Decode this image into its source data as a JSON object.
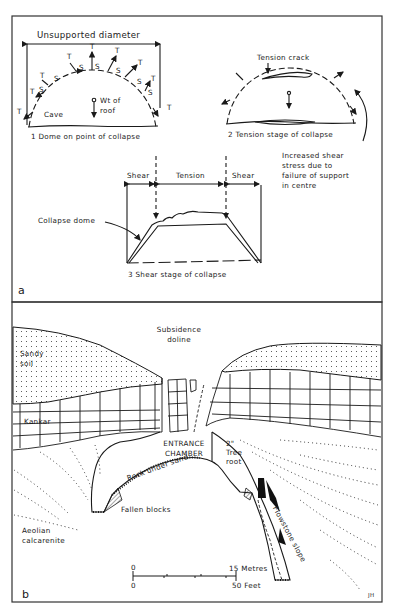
{
  "panel_a": {
    "label": "a",
    "dome1": {
      "caption": "1  Dome on point of collapse",
      "diameter_label": "Unsupported  diameter",
      "weight_label": "Wt of\nroof",
      "cave_label": "Cave",
      "stress_marks": [
        "T",
        "S",
        "T",
        "S",
        "T",
        "S",
        "T",
        "S",
        "T",
        "S",
        "T",
        "S",
        "T",
        "S",
        "T",
        "S",
        "T"
      ]
    },
    "dome2": {
      "caption": "2  Tension stage of collapse",
      "crack_label": "Tension crack",
      "note": "Increased shear\nstress due to\nfailure of support\nin centre"
    },
    "dome3": {
      "caption": "3 Shear stage of collapse",
      "zone_left": "Shear",
      "zone_mid": "Tension",
      "zone_right": "Shear",
      "dome_label": "Collapse dome"
    }
  },
  "panel_b": {
    "label": "b",
    "labels": {
      "doline": "Subsidence\ndoline",
      "sandy_soil": "Sandy\nsoil",
      "kankar": "Kankar",
      "entrance": "ENTRANCE\nCHAMBER",
      "tree_root": "2\"\nTree\nroot",
      "rock_under_sand": "Rock under sand",
      "fallen_blocks": "Fallen blocks",
      "aeolian": "Aeolian\ncalcarenite",
      "flowstone": "Flowstone slope"
    },
    "scale": {
      "metric_zero": "0",
      "metric_max": "15 Metres",
      "imperial_zero": "0",
      "imperial_max": "50 Feet"
    },
    "credit": "JH"
  }
}
